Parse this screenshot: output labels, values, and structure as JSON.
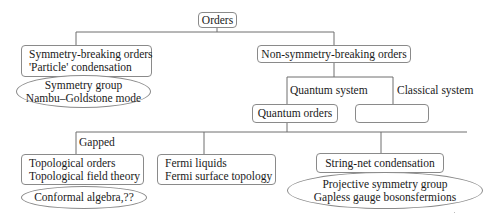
{
  "diagram": {
    "type": "tree",
    "root": {
      "label": "Orders"
    },
    "symmetry_breaking": {
      "box_lines": [
        "Symmetry-breaking orders",
        "'Particle' condensation"
      ],
      "ellipse_lines": [
        "Symmetry group",
        "Nambu–Goldstone mode"
      ]
    },
    "non_symmetry_breaking": {
      "label": "Non-symmetry-breaking orders",
      "branch_labels": {
        "quantum": "Quantum system",
        "classical": "Classical system"
      },
      "quantum_orders": {
        "label": "Quantum orders"
      },
      "classical_box": {
        "label": ""
      }
    },
    "quantum_branches": {
      "gapped_label": "Gapped",
      "topological": {
        "box_lines": [
          "Topological orders",
          "Topological field theory"
        ],
        "ellipse_lines": [
          "Conformal algebra,??"
        ]
      },
      "fermi": {
        "box_lines": [
          "Fermi liquids",
          "Fermi surface topology"
        ]
      },
      "string_net": {
        "box_lines": [
          "String-net condensation"
        ],
        "ellipse_lines": [
          "Projective symmetry group",
          "Gapless gauge bosonsfermions"
        ]
      }
    },
    "colors": {
      "line": "#6e6e6e",
      "border": "#8a8a8a",
      "text": "#1a1a1a",
      "background": "#ffffff"
    }
  }
}
